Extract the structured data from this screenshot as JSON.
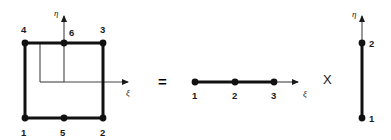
{
  "figure": {
    "background_color": "#ffffff",
    "ink_color": "#1a1a1a",
    "operators": {
      "equals": "=",
      "times": "X"
    }
  },
  "element_2d": {
    "name": "six-node-quadrilateral-element",
    "axes": {
      "xi_label": "ξ",
      "eta_label": "η"
    },
    "nodes": [
      {
        "id": "1",
        "label": "1",
        "x": 25,
        "y": 118,
        "label_x": 21,
        "label_y": 136
      },
      {
        "id": "2",
        "label": "2",
        "x": 103,
        "y": 118,
        "label_x": 100,
        "label_y": 136
      },
      {
        "id": "3",
        "label": "3",
        "x": 103,
        "y": 43,
        "label_x": 100,
        "label_y": 33
      },
      {
        "id": "4",
        "label": "4",
        "x": 25,
        "y": 43,
        "label_x": 21,
        "label_y": 33
      },
      {
        "id": "5",
        "label": "5",
        "x": 64,
        "y": 118,
        "label_x": 60,
        "label_y": 136
      },
      {
        "id": "6",
        "label": "6",
        "x": 64,
        "y": 43,
        "label_x": 69,
        "label_y": 36
      }
    ]
  },
  "element_1d_xi": {
    "name": "three-node-line-element",
    "axis_label": "ξ",
    "nodes": [
      {
        "id": "1",
        "label": "1",
        "x": 195,
        "y": 82,
        "label_x": 192,
        "label_y": 99
      },
      {
        "id": "2",
        "label": "2",
        "x": 235,
        "y": 82,
        "label_x": 232,
        "label_y": 99
      },
      {
        "id": "3",
        "label": "3",
        "x": 274,
        "y": 82,
        "label_x": 271,
        "label_y": 99
      }
    ]
  },
  "element_1d_eta": {
    "name": "two-node-line-element",
    "axis_label": "η",
    "nodes": [
      {
        "id": "1",
        "label": "1",
        "x": 362,
        "y": 118,
        "label_x": 369,
        "label_y": 122
      },
      {
        "id": "2",
        "label": "2",
        "x": 362,
        "y": 43,
        "label_x": 369,
        "label_y": 47
      }
    ]
  }
}
